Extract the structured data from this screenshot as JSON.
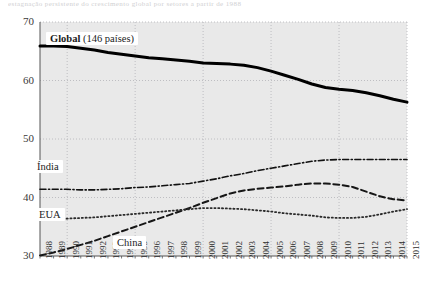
{
  "top_fragment": "estagnação  persistente  do  crescimento  global  por  setores  a  partir  de  1988",
  "chart_data": {
    "type": "line",
    "title": "",
    "subtitle": "",
    "xlabel": "",
    "ylabel": "",
    "xlim": [
      1988,
      2015
    ],
    "ylim": [
      30,
      70
    ],
    "grid": true,
    "legend_position": "inline-labels",
    "y_ticks": [
      30,
      40,
      50,
      60,
      70
    ],
    "x_gridlines": [
      1990,
      1995,
      2000,
      2005,
      2010,
      2015
    ],
    "x": [
      1988,
      1989,
      1990,
      1991,
      1992,
      1993,
      1994,
      1995,
      1996,
      1997,
      1998,
      1999,
      2000,
      2001,
      2002,
      2003,
      2004,
      2005,
      2006,
      2007,
      2008,
      2009,
      2010,
      2011,
      2012,
      2013,
      2014,
      2015
    ],
    "categories": [
      "1988",
      "1989",
      "1990",
      "1991",
      "1992",
      "1993",
      "1994",
      "1995",
      "1996",
      "1997",
      "1998",
      "1999",
      "2000",
      "2001",
      "2002",
      "2003",
      "2004",
      "2005",
      "2006",
      "2007",
      "2008",
      "2009",
      "2010",
      "2011",
      "2012",
      "2013",
      "2014",
      "2015"
    ],
    "series": [
      {
        "name": "Global",
        "label": "Global",
        "label_note": "(146 países)",
        "style": "solid",
        "color": "#000000",
        "width": 3.0,
        "values": [
          65.9,
          65.9,
          65.8,
          65.5,
          65.2,
          64.8,
          64.5,
          64.2,
          63.9,
          63.7,
          63.5,
          63.3,
          63.0,
          62.9,
          62.8,
          62.6,
          62.2,
          61.6,
          60.9,
          60.2,
          59.4,
          58.8,
          58.5,
          58.3,
          57.9,
          57.4,
          56.8,
          56.3
        ]
      },
      {
        "name": "Índia",
        "label": "Índia",
        "style": "dash-dot",
        "color": "#111111",
        "width": 1.6,
        "values": [
          41.4,
          41.4,
          41.4,
          41.3,
          41.3,
          41.4,
          41.5,
          41.7,
          41.8,
          42.0,
          42.2,
          42.4,
          42.8,
          43.2,
          43.7,
          44.1,
          44.6,
          45.0,
          45.4,
          45.8,
          46.2,
          46.4,
          46.5,
          46.5,
          46.5,
          46.5,
          46.5,
          46.5
        ]
      },
      {
        "name": "China",
        "label": "China",
        "style": "dashed",
        "color": "#161616",
        "width": 2.0,
        "values": [
          30.1,
          30.6,
          31.2,
          31.9,
          32.6,
          33.4,
          34.2,
          35.0,
          35.8,
          36.6,
          37.4,
          38.2,
          39.1,
          39.9,
          40.7,
          41.2,
          41.5,
          41.7,
          41.9,
          42.2,
          42.4,
          42.4,
          42.2,
          41.8,
          41.0,
          40.2,
          39.7,
          39.5
        ]
      },
      {
        "name": "EUA",
        "label": "EUA",
        "style": "dotted",
        "color": "#2a2a2a",
        "width": 1.8,
        "values": [
          36.2,
          36.3,
          36.4,
          36.5,
          36.6,
          36.8,
          37.0,
          37.2,
          37.4,
          37.6,
          37.8,
          38.0,
          38.2,
          38.2,
          38.1,
          38.0,
          37.8,
          37.6,
          37.3,
          37.1,
          36.9,
          36.6,
          36.5,
          36.5,
          36.7,
          37.1,
          37.6,
          38.0
        ]
      }
    ]
  },
  "axis_labels": {
    "y": [
      "70",
      "60",
      "50",
      "40",
      "30"
    ],
    "x": [
      "1988",
      "1989",
      "1990",
      "1991",
      "1992",
      "1993",
      "1994",
      "1995",
      "1996",
      "1997",
      "1998",
      "1999",
      "2000",
      "2001",
      "2002",
      "2003",
      "2004",
      "2005",
      "2006",
      "2007",
      "2008",
      "2009",
      "2010",
      "2011",
      "2012",
      "2013",
      "2014",
      "2015"
    ]
  },
  "colors": {
    "plot_background": "#e9e9e9",
    "gridline": "#b9b9bd",
    "axis": "#555555",
    "text": "#1b1b1b"
  }
}
